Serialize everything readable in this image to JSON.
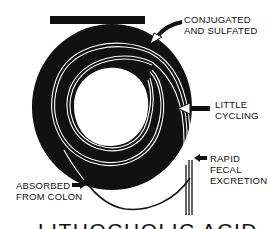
{
  "diagram": {
    "title": "LITHOCHOLIC ACID",
    "labels": {
      "conjugated_line1": "CONJUGATED",
      "conjugated_line2": "AND SULFATED",
      "little_line1": "LITTLE",
      "little_line2": "CYCLING",
      "rapid_line1": "RAPID",
      "rapid_line2": "FECAL",
      "rapid_line3": "EXCRETION",
      "absorbed_line1": "ABSORBED",
      "absorbed_line2": "FROM COLON"
    },
    "colors": {
      "ink": "#111111",
      "background": "#ffffff"
    }
  }
}
